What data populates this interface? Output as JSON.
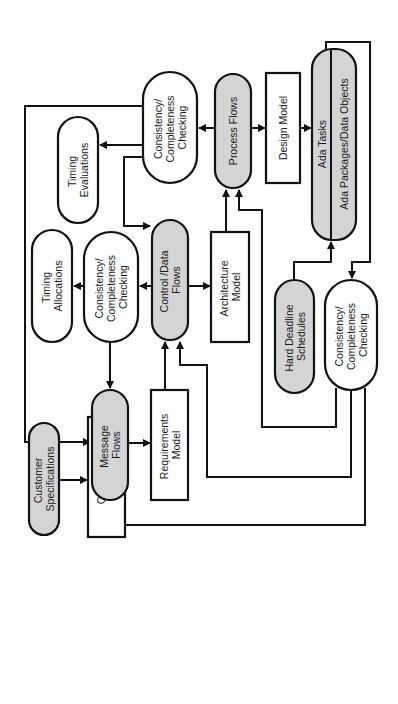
{
  "diagram": {
    "orientation": "rotated-90-ccw",
    "colors": {
      "shaded_fill": "#d4d4d4",
      "stroke": "#111111",
      "background": "#ffffff"
    },
    "nodes": [
      {
        "id": "customer-specs",
        "shape": "pill",
        "shaded": true,
        "lines": [
          "Customer",
          "Specifications"
        ]
      },
      {
        "id": "operations-model",
        "shape": "box",
        "shaded": false,
        "lines": [
          "Operations",
          "Model"
        ]
      },
      {
        "id": "message-flows",
        "shape": "pill",
        "shaded": true,
        "lines": [
          "Message",
          "Flows"
        ]
      },
      {
        "id": "requirements-model",
        "shape": "box",
        "shaded": false,
        "lines": [
          "Requirements",
          "Model"
        ]
      },
      {
        "id": "consistency-1",
        "shape": "pill",
        "shaded": false,
        "lines": [
          "Consistency/",
          "Completeness",
          "Checking"
        ]
      },
      {
        "id": "timing-allocations",
        "shape": "pill",
        "shaded": false,
        "lines": [
          "Timing",
          "Allocations"
        ]
      },
      {
        "id": "control-data-flows",
        "shape": "pill",
        "shaded": true,
        "lines": [
          "Control /Data",
          "Flows"
        ]
      },
      {
        "id": "architecture-model",
        "shape": "box",
        "shaded": false,
        "lines": [
          "Architecture",
          "Model"
        ]
      },
      {
        "id": "timing-evaluations",
        "shape": "pill",
        "shaded": false,
        "lines": [
          "Timing",
          "Evaluations"
        ]
      },
      {
        "id": "consistency-2",
        "shape": "pill",
        "shaded": false,
        "lines": [
          "Consistency/",
          "Completeness",
          "Checking"
        ]
      },
      {
        "id": "process-flows",
        "shape": "pill",
        "shaded": true,
        "lines": [
          "Process Flows"
        ]
      },
      {
        "id": "design-model",
        "shape": "box",
        "shaded": false,
        "lines": [
          "Design Model"
        ]
      },
      {
        "id": "ada-tasks",
        "shape": "split-pill",
        "shaded": true,
        "lines": [
          "Ada Tasks",
          "Ada Packages/Data Objects"
        ]
      },
      {
        "id": "hard-deadline",
        "shape": "pill",
        "shaded": true,
        "lines": [
          "Hard Deadline",
          "Schedules"
        ]
      },
      {
        "id": "consistency-3",
        "shape": "pill",
        "shaded": false,
        "lines": [
          "Consistency/",
          "Completeness",
          "Checking"
        ]
      }
    ],
    "edges": [
      {
        "from": "customer-specs",
        "to": "operations-model"
      },
      {
        "from": "operations-model",
        "to": "message-flows"
      },
      {
        "from": "message-flows",
        "to": "requirements-model"
      },
      {
        "from": "requirements-model",
        "to": "control-data-flows"
      },
      {
        "from": "control-data-flows",
        "to": "consistency-1"
      },
      {
        "from": "control-data-flows",
        "to": "architecture-model"
      },
      {
        "from": "consistency-1",
        "to": "timing-allocations"
      },
      {
        "from": "consistency-1",
        "to": "message-flows"
      },
      {
        "from": "architecture-model",
        "to": "process-flows"
      },
      {
        "from": "process-flows",
        "to": "consistency-2"
      },
      {
        "from": "process-flows",
        "to": "design-model"
      },
      {
        "from": "consistency-2",
        "to": "timing-evaluations"
      },
      {
        "from": "consistency-2",
        "to": "control-data-flows"
      },
      {
        "from": "consistency-2",
        "to": "message-flows"
      },
      {
        "from": "design-model",
        "to": "ada-tasks"
      },
      {
        "from": "hard-deadline",
        "to": "ada-tasks"
      },
      {
        "from": "ada-tasks",
        "to": "consistency-3"
      },
      {
        "from": "consistency-3",
        "to": "process-flows"
      },
      {
        "from": "consistency-3",
        "to": "control-data-flows"
      },
      {
        "from": "consistency-3",
        "to": "message-flows"
      }
    ]
  }
}
